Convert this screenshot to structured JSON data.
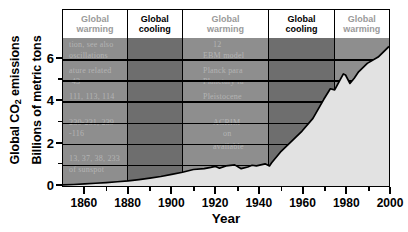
{
  "chart_data": {
    "type": "area",
    "title": "",
    "xlabel": "Year",
    "ylabel_line1": "Global CO2 emissions",
    "ylabel_line2": "Billions of metric tons",
    "xlim": [
      1850,
      2000
    ],
    "ylim": [
      0,
      7
    ],
    "x_major_ticks": [
      1860,
      1880,
      1900,
      1920,
      1940,
      1960,
      1980,
      2000
    ],
    "x_tick_labels": [
      "1860",
      "1880",
      "1900",
      "1920",
      "1940",
      "1960",
      "1980",
      "2000"
    ],
    "x_minor_tick_step": 10,
    "y_major_ticks": [
      0,
      2,
      4,
      6
    ],
    "y_tick_labels": [
      "0",
      "2",
      "4",
      "6"
    ],
    "y_minor_ticks": [
      1,
      3,
      5
    ],
    "grid": "horizontal",
    "legend": "none",
    "series": [
      {
        "name": "Global CO2 emissions",
        "units": "billions of metric tons",
        "x": [
          1850,
          1855,
          1860,
          1865,
          1870,
          1875,
          1880,
          1885,
          1890,
          1895,
          1900,
          1905,
          1910,
          1915,
          1918,
          1920,
          1922,
          1925,
          1929,
          1932,
          1935,
          1937,
          1939,
          1941,
          1943,
          1945,
          1946,
          1950,
          1955,
          1960,
          1965,
          1970,
          1973,
          1975,
          1979,
          1980,
          1982,
          1984,
          1986,
          1990,
          1995,
          2000
        ],
        "values": [
          0.05,
          0.07,
          0.1,
          0.13,
          0.16,
          0.2,
          0.24,
          0.3,
          0.37,
          0.45,
          0.55,
          0.65,
          0.78,
          0.82,
          0.88,
          0.93,
          0.84,
          0.95,
          1.0,
          0.82,
          0.9,
          0.98,
          0.95,
          1.0,
          1.05,
          0.95,
          1.1,
          1.6,
          2.1,
          2.6,
          3.2,
          4.1,
          4.6,
          4.55,
          5.3,
          5.25,
          4.85,
          5.1,
          5.4,
          5.8,
          6.1,
          6.6
        ]
      }
    ],
    "eras": [
      {
        "label_line1": "Global",
        "label_line2": "warming",
        "kind": "warming",
        "start": 1850,
        "end": 1880
      },
      {
        "label_line1": "Global",
        "label_line2": "cooling",
        "kind": "cooling",
        "start": 1880,
        "end": 1905
      },
      {
        "label_line1": "Global",
        "label_line2": "warming",
        "kind": "warming",
        "start": 1905,
        "end": 1945
      },
      {
        "label_line1": "Global",
        "label_line2": "cooling",
        "kind": "cooling",
        "start": 1945,
        "end": 1975
      },
      {
        "label_line1": "Global",
        "label_line2": "warming",
        "kind": "warming",
        "start": 1975,
        "end": 2000
      }
    ],
    "colors": {
      "band_warming": "#8e8e8e",
      "band_cooling": "#6e6e6e",
      "area_fill": "#e2e2e2",
      "curve": "#000000",
      "axis": "#000000",
      "warming_label": "#9a9a9a",
      "cooling_label": "#000000"
    }
  },
  "ghost_text": [
    "tion, see also",
    "oscillations",
    "ature related",
    "-43",
    "111, 113, 114",
    "230-231, 239",
    "-116",
    "13, 37, 38, 233",
    "of sunspot",
    "12",
    "EBM model",
    "Planck para",
    "Planetary ra",
    "Pleistocene",
    "ACRIM",
    "on",
    "available"
  ]
}
